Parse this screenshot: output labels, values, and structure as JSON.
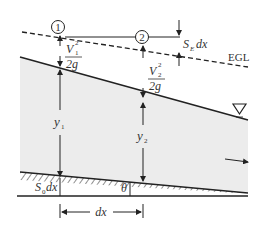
{
  "diagram": {
    "labels": {
      "section1": "1",
      "section2": "2",
      "velocity_head_1_num": "V",
      "velocity_head_1_sub": "1",
      "velocity_head_1_sup": "2",
      "velocity_head_2_num": "V",
      "velocity_head_2_sub": "2",
      "velocity_head_2_sup": "2",
      "velocity_head_den": "2g",
      "friction_loss_S": "S",
      "friction_loss_sub": "E",
      "friction_loss_dx": "dx",
      "egl": "EGL",
      "depth_1": "y",
      "depth_1_sub": "1",
      "depth_2": "y",
      "depth_2_sub": "2",
      "bed_drop_S": "S",
      "bed_drop_sub": "0",
      "bed_drop_dx": "dx",
      "angle": "θ",
      "length": "dx",
      "free_surface_symbol": "∇"
    },
    "colors": {
      "water": "#ececec",
      "line": "#222222",
      "text": "#333333"
    }
  }
}
